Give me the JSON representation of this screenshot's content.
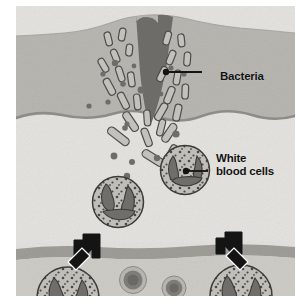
{
  "figure": {
    "background_color": "#ffffff",
    "plate_base_color": "#d8d6d2"
  },
  "labels": [
    {
      "id": "bacteria",
      "text": "Bacteria",
      "icon": "leader-line-icon",
      "color": "#121212",
      "anchor_point": {
        "x": 166,
        "y": 72
      },
      "text_point": {
        "x": 204,
        "y": 70
      }
    },
    {
      "id": "white-blood-cells",
      "line1": "White",
      "line2": "blood cells",
      "icon": "leader-line-icon",
      "color": "#121212",
      "anchor_point": {
        "x": 186,
        "y": 171
      },
      "text_point": {
        "x": 200,
        "y": 152
      }
    }
  ],
  "anatomy": {
    "epidermis": {
      "name": "epidermis",
      "color": "#b3b1ac",
      "description": "upper shaded skin band raised into a mound around the wound"
    },
    "dermis": {
      "name": "dermis",
      "color": "#e3e1dd",
      "description": "pale lower tissue layer containing white blood cells"
    },
    "boundary_line": {
      "name": "dermo-epidermal-junction",
      "color": "#8d8b86",
      "style": "wavy"
    },
    "wound": {
      "name": "puncture-wound",
      "color": "#6d6b67",
      "shape": "dark V-shaped wedge penetrating from surface into dermis"
    },
    "blood_vessel": {
      "name": "blood-vessel",
      "wall_color": "#9a9893",
      "lumen_color": "#c9c7c2",
      "description": "horizontal vessel band across the lower portion of the plate"
    }
  },
  "cells": {
    "bacteria": {
      "name": "bacteria-rod",
      "fill": "#c2c0bb",
      "stroke": "#4d4b48",
      "shape": "rod",
      "count": 28
    },
    "bacteria_dots": {
      "name": "bacteria-coccus",
      "fill": "#6e6c68",
      "shape": "circle",
      "count": 17
    },
    "white_blood_cells": {
      "name": "white-blood-cell",
      "cytoplasm_fill": "#bfbdb8",
      "granule_fill": "#4a4845",
      "nucleus_fill": "#6f6d69",
      "stroke": "#3b3936",
      "count_in_tissue": 2,
      "count_in_vessel": 2
    },
    "red_blood_cells": {
      "name": "red-blood-cell",
      "outer_fill": "#b6b4af",
      "ring_fill": "#7d7b77",
      "center_fill": "#6a6864",
      "count": 2
    }
  },
  "arrows": [
    {
      "id": "arrow-left",
      "name": "migration-arrow-left",
      "direction": "up-right",
      "color": "#141414",
      "description": "white blood cell leaving the vessel and moving up toward the wound"
    },
    {
      "id": "arrow-right",
      "name": "migration-arrow-right",
      "direction": "up-left",
      "color": "#141414",
      "description": "white blood cell leaving the vessel and moving up toward the wound"
    }
  ]
}
